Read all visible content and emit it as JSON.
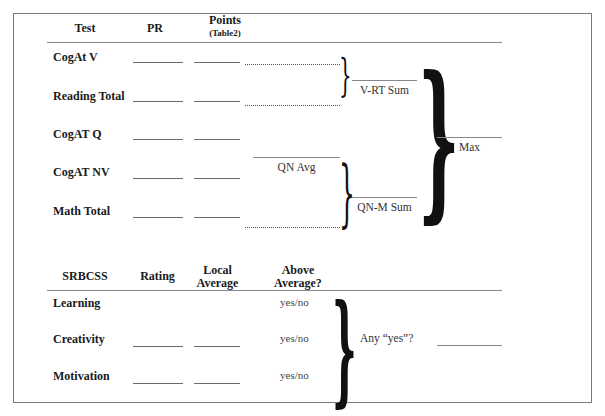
{
  "section1": {
    "headers": {
      "test": "Test",
      "pr": "PR",
      "points": "Points",
      "points_sub": "(Table2)"
    },
    "rows": [
      {
        "label": "CogAt V"
      },
      {
        "label": "Reading Total"
      },
      {
        "label": "CogAT Q"
      },
      {
        "label": "CogAT NV"
      },
      {
        "label": "Math Total"
      }
    ],
    "labels": {
      "vrt_sum": "V-RT Sum",
      "qn_avg": "QN Avg",
      "qnm_sum": "QN-M Sum",
      "max": "Max"
    }
  },
  "section2": {
    "headers": {
      "srbcss": "SRBCSS",
      "rating": "Rating",
      "local_average_1": "Local",
      "local_average_2": "Average",
      "above_average_1": "Above",
      "above_average_2": "Average?"
    },
    "rows": [
      {
        "label": "Learning",
        "yn": "yes/no"
      },
      {
        "label": "Creativity",
        "yn": "yes/no"
      },
      {
        "label": "Motivation",
        "yn": "yes/no"
      }
    ],
    "any_yes": "Any “yes”?"
  }
}
